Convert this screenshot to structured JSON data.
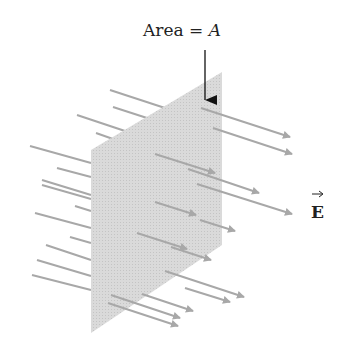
{
  "labels": {
    "area_text": "Area = ",
    "area_symbol": "A",
    "field_symbol": "E"
  },
  "colors": {
    "plane": "#d4d4d4",
    "field_lines": "#a8a8a8",
    "text": "#222222",
    "pointer": "#111111"
  },
  "plane": {
    "points": [
      [
        91,
        150
      ],
      [
        222,
        72
      ],
      [
        222,
        245
      ],
      [
        91,
        333
      ]
    ]
  },
  "back_lines": [
    [
      110,
      90,
      165,
      108
    ],
    [
      113,
      107,
      147,
      118
    ],
    [
      77,
      115,
      128,
      132
    ],
    [
      96,
      133,
      113,
      139
    ],
    [
      30,
      146,
      91,
      163
    ],
    [
      57,
      168,
      91,
      177
    ],
    [
      42,
      180,
      91,
      195
    ],
    [
      42,
      185,
      91,
      199
    ],
    [
      75,
      206,
      91,
      211
    ],
    [
      35,
      213,
      91,
      228
    ],
    [
      70,
      237,
      91,
      243
    ],
    [
      46,
      245,
      91,
      260
    ],
    [
      37,
      260,
      91,
      276
    ],
    [
      32,
      275,
      91,
      290
    ]
  ],
  "front_lines": [
    [
      201,
      88,
      284,
      117
    ],
    [
      212,
      96,
      222,
      99
    ],
    [
      160,
      110,
      222,
      131
    ],
    [
      186,
      120,
      222,
      132
    ],
    [
      133,
      132,
      222,
      161
    ],
    [
      155,
      149,
      222,
      171
    ],
    [
      115,
      170,
      208,
      200
    ],
    [
      186,
      165,
      222,
      177
    ],
    [
      148,
      186,
      222,
      211
    ],
    [
      136,
      195,
      200,
      218
    ],
    [
      165,
      228,
      222,
      247
    ],
    [
      128,
      233,
      200,
      257
    ],
    [
      158,
      255,
      212,
      272
    ],
    [
      147,
      262,
      200,
      280
    ],
    [
      115,
      268,
      200,
      295
    ],
    [
      110,
      290,
      195,
      318
    ],
    [
      115,
      302,
      183,
      324
    ]
  ],
  "arrows": [
    [
      201,
      108,
      290,
      137
    ],
    [
      213,
      128,
      292,
      154
    ],
    [
      155,
      154,
      215,
      173
    ],
    [
      188,
      169,
      259,
      193
    ],
    [
      197,
      184,
      292,
      214
    ],
    [
      155,
      202,
      196,
      215
    ],
    [
      200,
      220,
      235,
      231
    ],
    [
      137,
      233,
      187,
      249
    ],
    [
      171,
      247,
      211,
      260
    ],
    [
      165,
      271,
      244,
      297
    ],
    [
      185,
      288,
      230,
      302
    ],
    [
      142,
      294,
      193,
      311
    ],
    [
      108,
      303,
      178,
      326
    ],
    [
      111,
      295,
      180,
      318
    ]
  ],
  "pointer": {
    "x": 205,
    "y1": 50,
    "y2": 100
  }
}
